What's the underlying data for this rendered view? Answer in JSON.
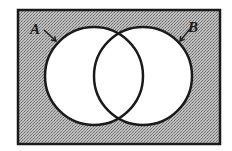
{
  "diagram": {
    "type": "venn",
    "shaded_region": "complement of A union B",
    "colors": {
      "background": "#ffffff",
      "shade": "#a9a9a9",
      "circle_fill": "#ffffff",
      "stroke": "#1a1a1a"
    },
    "universe": {
      "x": 18,
      "y": 10,
      "width": 202,
      "height": 134
    },
    "sets": [
      {
        "name": "A",
        "label": "A",
        "cx": 94,
        "cy": 76,
        "r": 49,
        "label_x": 36,
        "label_y": 34,
        "arrow": [
          44,
          30,
          56,
          41
        ]
      },
      {
        "name": "B",
        "label": "B",
        "cx": 143,
        "cy": 76,
        "r": 49,
        "label_x": 194,
        "label_y": 32,
        "arrow": [
          190,
          29,
          180,
          41
        ]
      }
    ]
  }
}
